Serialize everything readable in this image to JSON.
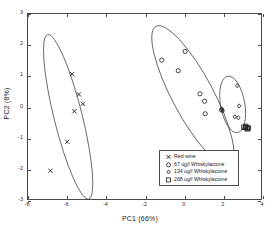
{
  "chart_data": {
    "type": "scatter",
    "title": "",
    "xlabel": "PC1 (66%)",
    "ylabel": "PC2 (8%)",
    "xlim": [
      -8,
      4
    ],
    "ylim": [
      -3,
      3
    ],
    "xticks": [
      "-8",
      "-6",
      "-4",
      "-2",
      "0",
      "2",
      "4"
    ],
    "xtick_values": [
      -8,
      -6,
      -4,
      -2,
      0,
      2,
      4
    ],
    "yticks": [
      "3",
      "2",
      "1",
      "0",
      "-1",
      "-2",
      "-3"
    ],
    "ytick_values": [
      3,
      2,
      1,
      0,
      -1,
      -2,
      -3
    ],
    "grid": false,
    "legend_position": "lower-right-inside",
    "marker_color": "#1a1a1a",
    "ellipse_color": "#3a3a3a",
    "axis_color": "#4a4a4a",
    "series": [
      {
        "name": "Red wine",
        "marker": "x",
        "points": [
          [
            -5.75,
            1.07
          ],
          [
            -5.4,
            0.42
          ],
          [
            -5.2,
            0.12
          ],
          [
            -5.63,
            -0.12
          ],
          [
            -6.0,
            -1.1
          ],
          [
            -6.85,
            -2.03
          ]
        ]
      },
      {
        "name": "67 ug/l Whiskylactone",
        "marker": "o",
        "points": [
          [
            0.02,
            1.8
          ],
          [
            -1.17,
            1.52
          ],
          [
            -0.33,
            1.18
          ],
          [
            0.78,
            0.44
          ],
          [
            1.02,
            0.2
          ],
          [
            1.05,
            -0.2
          ],
          [
            1.88,
            -0.08
          ]
        ]
      },
      {
        "name": "134 ug/l Whiskylactone",
        "marker": "d",
        "points": [
          [
            1.9,
            -0.05
          ],
          [
            1.95,
            -0.1
          ],
          [
            2.68,
            0.7
          ],
          [
            2.78,
            0.05
          ],
          [
            2.56,
            -0.3
          ],
          [
            2.74,
            -0.33
          ]
        ]
      },
      {
        "name": "268 ug/l Whiskylactone",
        "marker": "s",
        "points": [
          [
            3.02,
            -0.63
          ],
          [
            3.1,
            -0.65
          ],
          [
            3.18,
            -0.64
          ],
          [
            3.26,
            -0.66
          ],
          [
            3.12,
            -0.6
          ],
          [
            3.2,
            -0.69
          ]
        ]
      }
    ],
    "ellipses": [
      {
        "label": "Red wine",
        "cx": -5.95,
        "cy": -0.3,
        "rx": 0.72,
        "ry": 2.72,
        "angle": -14
      },
      {
        "label": "67 ug/l Whiskylactone",
        "cx": 0.42,
        "cy": 0.38,
        "rx": 1.05,
        "ry": 2.52,
        "angle": -28
      },
      {
        "label": "134 ug/l Whiskylactone",
        "cx": 2.45,
        "cy": 0.1,
        "rx": 0.62,
        "ry": 0.92,
        "angle": -10
      }
    ],
    "legend": [
      {
        "marker": "x",
        "label": "Red wine"
      },
      {
        "marker": "o",
        "label": "67 ug/l Whiskylactone"
      },
      {
        "marker": "d",
        "label": "134 ug/l Whiskylactone"
      },
      {
        "marker": "s",
        "label": "268 ug/l Whiskylactone"
      }
    ]
  }
}
